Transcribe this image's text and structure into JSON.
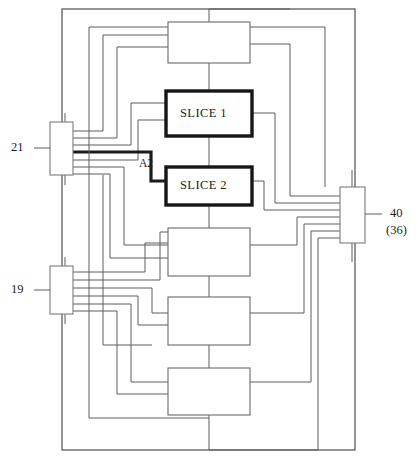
{
  "figure": {
    "kind": "patent-block-diagram",
    "background_color": "#ffffff",
    "line_color": "#5d5d63",
    "bold_line_color": "#1b1b1b",
    "text_color": "#1d1d1d"
  },
  "blocks": {
    "top": {
      "label": ""
    },
    "slice1": {
      "label": "SLICE 1"
    },
    "slice2": {
      "label": "SLICE 2"
    },
    "mid1": {
      "label": ""
    },
    "mid2": {
      "label": ""
    },
    "bottom": {
      "label": ""
    }
  },
  "connectors": {
    "left_top": {
      "ref": "21"
    },
    "left_bottom": {
      "ref": "19"
    },
    "right": {
      "ref": "40",
      "ref_alt": "(36)"
    }
  },
  "signals": {
    "a2": {
      "label": "A2"
    }
  }
}
